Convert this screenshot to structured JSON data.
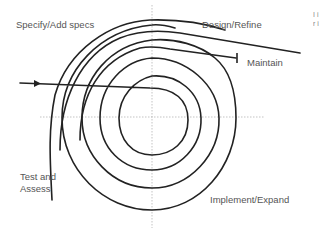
{
  "diagram": {
    "type": "spiral-lifecycle",
    "labels": {
      "specify": "Specify/Add specs",
      "design": "Design/Refine",
      "maintain": "Maintain",
      "test_line1": "Test and",
      "test_line2": "Assess",
      "implement": "Implement/Expand"
    },
    "edge_text_fragment": "I i r i",
    "colors": {
      "stroke": "#222222",
      "text": "#555555",
      "axis": "#aaaaaa"
    }
  }
}
